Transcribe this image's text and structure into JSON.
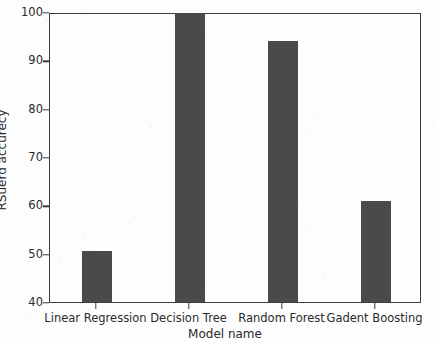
{
  "chart_data": {
    "type": "bar",
    "title": "",
    "xlabel": "Model name",
    "ylabel": "RSuerd accurecy",
    "categories": [
      "Linear Regression",
      "Decision Tree",
      "Random Forest",
      "Gadent Boosting"
    ],
    "values": [
      50.6,
      99.8,
      94.0,
      61.0
    ],
    "ylim": [
      40,
      100
    ],
    "yticks": [
      40,
      50,
      60,
      70,
      80,
      90,
      100
    ],
    "ytick_labels": [
      "40",
      "50",
      "60",
      "70",
      "80",
      "90",
      "100"
    ],
    "grid": false,
    "legend": null,
    "bar_color": "#4a4a4a",
    "axis_color": "#3d3d3d",
    "background_color": "#fdfdfd",
    "series": [
      {
        "name": "RSuerd accurecy",
        "values": [
          50.6,
          99.8,
          94.0,
          61.0
        ]
      }
    ]
  }
}
